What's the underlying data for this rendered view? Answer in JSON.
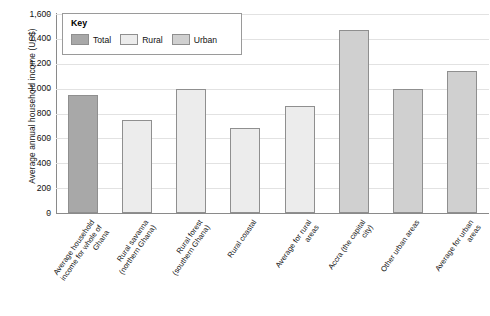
{
  "chart_data": {
    "type": "bar",
    "title": "",
    "xlabel": "",
    "ylabel": "Average annual household income (US$)",
    "ylim": [
      0,
      1600
    ],
    "ytick_values": [
      0,
      200,
      400,
      600,
      800,
      1000,
      1200,
      1400,
      1600
    ],
    "ytick_labels": [
      "0",
      "200",
      "400",
      "600",
      "800",
      "1,000",
      "1,200",
      "1,400",
      "1,600"
    ],
    "grid": true,
    "legend_position": "top-left",
    "categories": [
      "Average household income for whole of Ghana",
      "Rural savanna (northern Ghana)",
      "Rural forest (southern Ghana)",
      "Rural coastal",
      "Average for rural areas",
      "Accra (the capital city)",
      "Other urban areas",
      "Average for urban areas"
    ],
    "category_lines": [
      [
        "Average household",
        "income for whole of",
        "Ghana"
      ],
      [
        "Rural savanna",
        "(northern Ghana)"
      ],
      [
        "Rural forest",
        "(southern Ghana)"
      ],
      [
        "Rural coastal"
      ],
      [
        "Average for rural",
        "areas"
      ],
      [
        "Accra (the capital",
        "city)"
      ],
      [
        "Other urban areas"
      ],
      [
        "Average for urban",
        "areas"
      ]
    ],
    "values": [
      950,
      750,
      1000,
      680,
      860,
      1470,
      1000,
      1140
    ],
    "series_of_each_bar": [
      "Total",
      "Rural",
      "Rural",
      "Rural",
      "Rural",
      "Urban",
      "Urban",
      "Urban"
    ],
    "legend": {
      "title": "Key",
      "entries": [
        {
          "label": "Total",
          "color": "#a8a8a8"
        },
        {
          "label": "Rural",
          "color": "#ececec"
        },
        {
          "label": "Urban",
          "color": "#d0d0d0"
        }
      ]
    },
    "colors": {
      "Total": "#a8a8a8",
      "Rural": "#ececec",
      "Urban": "#d0d0d0",
      "bar_border": "#8f8f8f",
      "gridline": "#e2e2e2",
      "axis": "#8a8a8a",
      "text": "#111111",
      "background": "#ffffff"
    }
  }
}
